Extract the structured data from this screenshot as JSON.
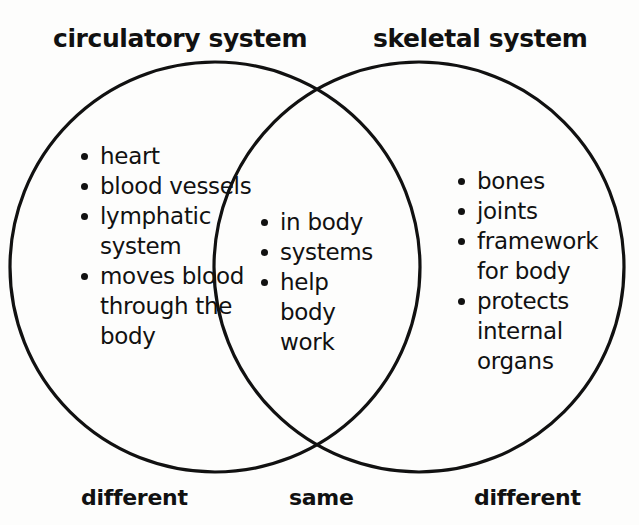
{
  "diagram": {
    "type": "venn",
    "title_left": "circulatory system",
    "title_right": "skeletal system",
    "stroke_color": "#111111",
    "background_color": "#fdfdfc",
    "left_circle": {
      "cx": 215,
      "cy": 267,
      "r": 205
    },
    "right_circle": {
      "cx": 419,
      "cy": 267,
      "r": 205
    }
  },
  "left_set": {
    "heading": "circulatory system",
    "caption": "different",
    "items": [
      "heart",
      "blood vessels",
      "lymphatic system",
      "moves blood through the body"
    ]
  },
  "intersection_set": {
    "caption": "same",
    "items": [
      "in body",
      "systems",
      "help body work"
    ]
  },
  "right_set": {
    "heading": "skeletal system",
    "caption": "different",
    "items": [
      "bones",
      "joints",
      "framework for body",
      "protects internal organs"
    ]
  }
}
